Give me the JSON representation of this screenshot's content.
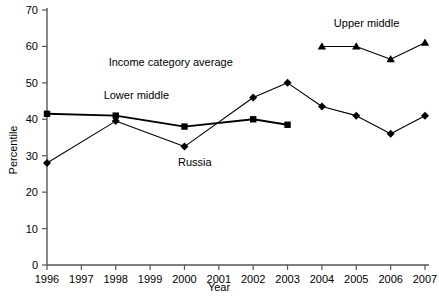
{
  "chart_data": {
    "type": "line",
    "title": "",
    "xlabel": "Year",
    "ylabel": "Percentile",
    "xlim": [
      1996,
      2007
    ],
    "ylim": [
      0,
      70
    ],
    "ytick_labels": [
      "0",
      "10",
      "20",
      "30",
      "40",
      "50",
      "60",
      "70"
    ],
    "ytick_values": [
      0,
      10,
      20,
      30,
      40,
      50,
      60,
      70
    ],
    "xtick_labels": [
      "1996",
      "1997",
      "1998",
      "1999",
      "2000",
      "2001",
      "2002",
      "2003",
      "2004",
      "2005",
      "2006",
      "2007"
    ],
    "xtick_values": [
      1996,
      1997,
      1998,
      1999,
      2000,
      2001,
      2002,
      2003,
      2004,
      2005,
      2006,
      2007
    ],
    "grid": false,
    "legend": "inline-annotations",
    "series": [
      {
        "name": "Russia",
        "marker": "diamond",
        "color": "#000000",
        "x": [
          1996,
          1998,
          2000,
          2002,
          2003,
          2004,
          2005,
          2006,
          2007
        ],
        "values": [
          28,
          39.5,
          32.5,
          46,
          50,
          43.5,
          41,
          36,
          41
        ]
      },
      {
        "name": "Lower middle",
        "marker": "square",
        "color": "#000000",
        "x": [
          1996,
          1998,
          2000,
          2002,
          2003
        ],
        "values": [
          41.5,
          41,
          38,
          40,
          38.5
        ]
      },
      {
        "name": "Upper middle",
        "marker": "triangle",
        "color": "#000000",
        "x": [
          2004,
          2005,
          2006,
          2007
        ],
        "values": [
          60,
          60,
          56.5,
          61
        ]
      }
    ],
    "annotations": [
      {
        "id": "income-category-average",
        "text": "Income category average",
        "x": 1999.6,
        "y": 54.5
      },
      {
        "id": "lower-middle",
        "text": "Lower middle",
        "x": 1998.6,
        "y": 45.6
      },
      {
        "id": "russia",
        "text": "Russia",
        "x": 2000.3,
        "y": 27.3
      },
      {
        "id": "upper-middle",
        "text": "Upper middle",
        "x": 2005.3,
        "y": 65.4
      }
    ]
  },
  "axis": {
    "x_title": "Year",
    "y_title": "Percentile"
  }
}
